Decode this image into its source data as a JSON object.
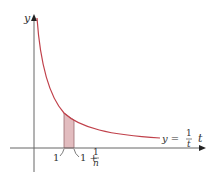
{
  "diagram": {
    "function": "y = 1/t",
    "axes": {
      "x_label": "t",
      "y_label": "y"
    },
    "labels": {
      "y_axis": "y",
      "t_axis": "t",
      "curve_lhs": "y =",
      "curve_num": "1",
      "curve_den": "t",
      "tick_1": "1",
      "tick_1n_prefix": "1 +",
      "tick_1n_num": "1",
      "tick_1n_den": "n"
    },
    "shaded_region": {
      "from": "1",
      "to": "1 + 1/n"
    },
    "colors": {
      "curve": "#c0404a",
      "shade": "#e2bcbf",
      "axis": "#555555"
    }
  }
}
